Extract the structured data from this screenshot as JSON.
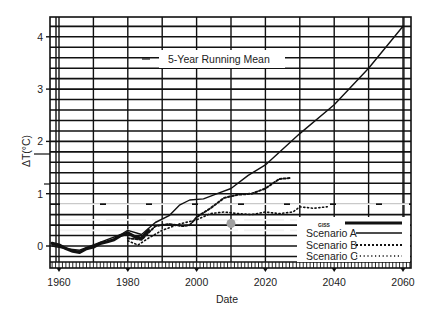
{
  "chart_data": {
    "type": "line",
    "title": "5-Year Running Mean",
    "xlabel": "Date",
    "ylabel": "ΔT(°C)",
    "xlim": [
      1957,
      2062
    ],
    "ylim": [
      -0.45,
      4.4
    ],
    "x_ticks": [
      "1960",
      "1980",
      "2000",
      "2020",
      "2040",
      "2060"
    ],
    "y_ticks": [
      "0",
      "1",
      "2",
      "3",
      "4"
    ],
    "grid": true,
    "legend_position": "lower right",
    "legend": [
      "GISS observed",
      "Scenario A",
      "Scenario B",
      "Scenario C"
    ],
    "series": [
      {
        "name": "GISS observed",
        "style": "thick solid",
        "x": [
          1958,
          1960,
          1962,
          1964,
          1966,
          1968,
          1970,
          1972,
          1974,
          1976,
          1978,
          1980,
          1982,
          1984,
          1986
        ],
        "y": [
          0.05,
          0.02,
          -0.05,
          -0.1,
          -0.12,
          -0.05,
          -0.02,
          0.05,
          0.08,
          0.12,
          0.2,
          0.25,
          0.18,
          0.15,
          0.3
        ]
      },
      {
        "name": "Scenario A",
        "style": "solid",
        "x": [
          1958,
          1962,
          1966,
          1970,
          1974,
          1978,
          1980,
          1984,
          1988,
          1992,
          1995,
          1998,
          2002,
          2006,
          2010,
          2015,
          2020,
          2030,
          2040,
          2050,
          2060
        ],
        "y": [
          0.0,
          -0.05,
          -0.08,
          0.02,
          0.12,
          0.22,
          0.3,
          0.22,
          0.45,
          0.58,
          0.78,
          0.88,
          0.9,
          1.0,
          1.1,
          1.35,
          1.55,
          2.15,
          2.7,
          3.4,
          4.2
        ]
      },
      {
        "name": "Scenario B",
        "style": "dashed",
        "x": [
          1980,
          1984,
          1988,
          1992,
          1996,
          1998,
          2000,
          2004,
          2008,
          2012,
          2016,
          2020,
          2024,
          2027
        ],
        "y": [
          0.15,
          0.12,
          0.38,
          0.42,
          0.38,
          0.4,
          0.55,
          0.72,
          0.92,
          0.98,
          1.0,
          1.1,
          1.28,
          1.3
        ]
      },
      {
        "name": "Scenario C",
        "style": "dotted",
        "x": [
          1980,
          1983,
          1986,
          1990,
          1995,
          2000,
          2004,
          2008,
          2012,
          2016,
          2020,
          2024,
          2028,
          2030,
          2034,
          2038
        ],
        "y": [
          0.1,
          0.02,
          0.15,
          0.3,
          0.42,
          0.5,
          0.62,
          0.65,
          0.62,
          0.6,
          0.65,
          0.62,
          0.65,
          0.75,
          0.72,
          0.75
        ]
      }
    ],
    "annotations": [
      {
        "type": "marker",
        "x": 2010,
        "y": 0.43,
        "color": "#a0a0a0"
      }
    ]
  }
}
